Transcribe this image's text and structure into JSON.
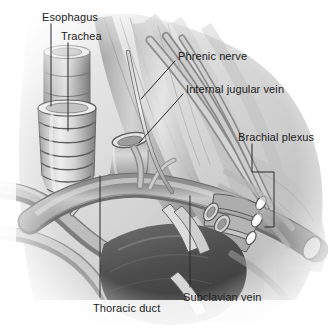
{
  "figure": {
    "kind": "anatomical-illustration",
    "style": "grayscale medical drawing",
    "width": 328,
    "height": 331,
    "background_color": "#ffffff",
    "label_color": "#1b1b1b",
    "leader_line_color": "#2a2a2a"
  },
  "labels": [
    {
      "id": "esophagus",
      "text": "Esophagus",
      "x": 42,
      "y": 11,
      "leader": {
        "type": "line",
        "points": "51,24 51,106"
      }
    },
    {
      "id": "trachea",
      "text": "Trachea",
      "x": 61,
      "y": 30,
      "leader": {
        "type": "line",
        "points": "68,43 68,131"
      }
    },
    {
      "id": "phrenic-nerve",
      "text": "Phrenic nerve",
      "x": 178,
      "y": 50,
      "leader": {
        "type": "line",
        "points": "175,61 141,99"
      }
    },
    {
      "id": "internal-jugular-vein",
      "text": "Internal jugular vein",
      "x": 186,
      "y": 83,
      "leader": {
        "type": "line",
        "points": "183,94 139,143"
      }
    },
    {
      "id": "brachial-plexus",
      "text": "Brachial plexus",
      "x": 238,
      "y": 131,
      "leader": {
        "type": "bracket",
        "points": "252,144 252,172 274,172 274,227 265,227"
      }
    },
    {
      "id": "thoracic-duct",
      "text": "Thoracic duct",
      "x": 93,
      "y": 302,
      "leader": {
        "type": "line",
        "points": "100,176 100,297"
      }
    },
    {
      "id": "subclavian-vein",
      "text": "Subclavian vein",
      "x": 183,
      "y": 291,
      "leader": {
        "type": "line",
        "points": "190,196 190,287"
      }
    }
  ],
  "structures": [
    {
      "id": "esophagus-tube",
      "name": "Esophagus",
      "note": "smooth cut tube, upper left"
    },
    {
      "id": "trachea-tube",
      "name": "Trachea",
      "note": "ringed cartilage tube, left"
    },
    {
      "id": "phrenic-nerve-strand",
      "name": "Phrenic nerve",
      "note": "slender nerve crossing scalene"
    },
    {
      "id": "internal-jugular-vein-stump",
      "name": "Internal jugular vein",
      "note": "cut vein with open lumen"
    },
    {
      "id": "brachial-plexus-trunks",
      "name": "Brachial plexus",
      "note": "three cut nerve trunks, right"
    },
    {
      "id": "thoracic-duct-strand",
      "name": "Thoracic duct",
      "note": "thin duct arching to venous angle"
    },
    {
      "id": "subclavian-vein-arch",
      "name": "Subclavian vein",
      "note": "large arching vein across field"
    },
    {
      "id": "subclavian-artery",
      "name": "Subclavian artery",
      "note": "deep vessel behind vein"
    },
    {
      "id": "clavicle-shadow",
      "name": "Clavicle",
      "note": "dark mass lower center"
    }
  ]
}
